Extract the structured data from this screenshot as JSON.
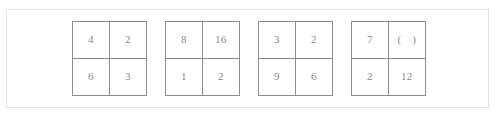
{
  "question": {
    "panel_border_color": "#e3e3e3",
    "grid_border_color": "#8d8d8d",
    "text_color": "#8a8a8a",
    "background_color": "#ffffff",
    "grids": [
      {
        "name": "grid-1",
        "cells": [
          {
            "position": "top-left",
            "value": "4"
          },
          {
            "position": "top-right",
            "value": "2"
          },
          {
            "position": "bottom-left",
            "value": "6"
          },
          {
            "position": "bottom-right",
            "value": "3"
          }
        ]
      },
      {
        "name": "grid-2",
        "cells": [
          {
            "position": "top-left",
            "value": "8"
          },
          {
            "position": "top-right",
            "value": "16"
          },
          {
            "position": "bottom-left",
            "value": "1"
          },
          {
            "position": "bottom-right",
            "value": "2"
          }
        ]
      },
      {
        "name": "grid-3",
        "cells": [
          {
            "position": "top-left",
            "value": "3"
          },
          {
            "position": "top-right",
            "value": "2"
          },
          {
            "position": "bottom-left",
            "value": "9"
          },
          {
            "position": "bottom-right",
            "value": "6"
          }
        ]
      },
      {
        "name": "grid-4",
        "cells": [
          {
            "position": "top-left",
            "value": "7"
          },
          {
            "position": "top-right",
            "value": "(    )"
          },
          {
            "position": "bottom-left",
            "value": "2"
          },
          {
            "position": "bottom-right",
            "value": "12"
          }
        ]
      }
    ]
  }
}
